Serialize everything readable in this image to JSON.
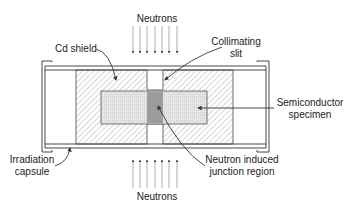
{
  "diagram": {
    "labels": {
      "neutrons_top": "Neutrons",
      "neutrons_bottom": "Neutrons",
      "cd_shield": "Cd shield",
      "collimating_slit_line1": "Collimating",
      "collimating_slit_line2": "slit",
      "semiconductor_line1": "Semiconductor",
      "semiconductor_line2": "specimen",
      "irradiation_line1": "Irradiation",
      "irradiation_line2": "capsule",
      "junction_line1": "Neutron induced",
      "junction_line2": "junction region"
    },
    "colors": {
      "line": "#333333",
      "specimen_fill": "#e4e4e4",
      "junction_fill": "#9a9a9a",
      "hatch": "#888888"
    }
  }
}
